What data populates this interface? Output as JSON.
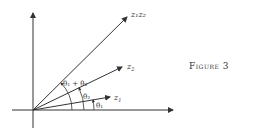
{
  "caption": "Figure 3",
  "vectors": [
    {
      "name": "z1",
      "label_main": "z",
      "label_sub": "1"
    },
    {
      "name": "z2",
      "label_main": "z",
      "label_sub": "2"
    },
    {
      "name": "z1z2",
      "label": "z₁z₂"
    }
  ],
  "angles": {
    "theta1": "θ₁",
    "theta2": "θ₂",
    "sum": "θ₁ + θ₂"
  },
  "colors": {
    "ink": "#333333",
    "background": "#ffffff"
  }
}
